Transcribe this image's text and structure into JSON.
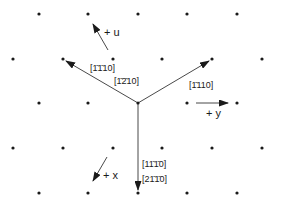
{
  "diagram": {
    "type": "hexagonal lattice directions",
    "colors": {
      "ink": "#1a1a1a",
      "background": "#ffffff"
    },
    "lattice_points": [
      [
        39,
        14
      ],
      [
        88,
        14
      ],
      [
        138,
        14
      ],
      [
        187,
        14
      ],
      [
        237,
        14
      ],
      [
        13,
        59
      ],
      [
        63,
        59
      ],
      [
        113,
        59
      ],
      [
        162,
        59
      ],
      [
        212,
        59
      ],
      [
        262,
        59
      ],
      [
        39,
        103
      ],
      [
        88,
        103
      ],
      [
        138,
        103
      ],
      [
        187,
        103
      ],
      [
        237,
        103
      ],
      [
        13,
        148
      ],
      [
        63,
        148
      ],
      [
        113,
        148
      ],
      [
        162,
        148
      ],
      [
        212,
        148
      ],
      [
        262,
        148
      ],
      [
        39,
        193
      ],
      [
        88,
        193
      ],
      [
        138,
        193
      ],
      [
        187,
        193
      ],
      [
        237,
        193
      ]
    ],
    "origin": [
      138,
      103
    ],
    "vectors": [
      {
        "name": "upper-left",
        "to": [
          63,
          59
        ],
        "labels": [
          "[1̄1̄10]",
          "[1̄2̄10]"
        ]
      },
      {
        "name": "upper-right",
        "to": [
          212,
          59
        ],
        "labels": [
          "[1̄110]"
        ]
      },
      {
        "name": "down",
        "to": [
          138,
          193
        ],
        "labels": [
          "[11̄1̄0]",
          "[211̄0]"
        ]
      }
    ],
    "labels": {
      "upper_left_1": "[1̄1̄10]",
      "upper_left_2": "[1̄2̄10]",
      "upper_right": "[1̄110]",
      "down_1": "[11̄1̄0]",
      "down_2": "[21̄1̄0]"
    },
    "axes": {
      "u": {
        "label": "+ u",
        "from": [
          108,
          50
        ],
        "to": [
          92,
          22
        ]
      },
      "y": {
        "label": "+ y",
        "from": [
          195,
          103
        ],
        "to": [
          229,
          103
        ]
      },
      "x": {
        "label": "+ x",
        "from": [
          107,
          157
        ],
        "to": [
          92,
          182
        ]
      }
    }
  }
}
